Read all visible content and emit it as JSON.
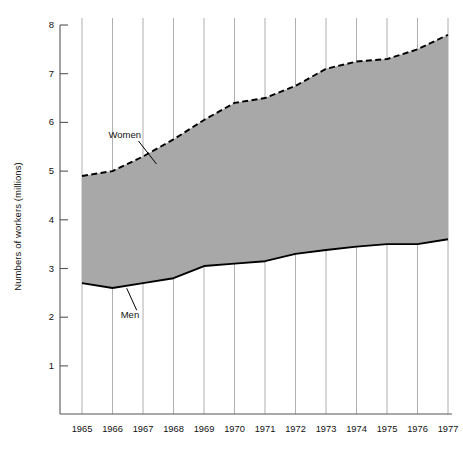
{
  "chart_data": {
    "type": "area",
    "title": "",
    "xlabel": "",
    "ylabel": "Numbers of workers (millions)",
    "categories": [
      1965,
      1966,
      1967,
      1968,
      1969,
      1970,
      1971,
      1972,
      1973,
      1974,
      1975,
      1976,
      1977
    ],
    "xtick_labels": [
      "1965",
      "1966",
      "1967",
      "1968",
      "1969",
      "1970",
      "1971",
      "1972",
      "1973",
      "1974",
      "1975",
      "1976",
      "1977"
    ],
    "ytick_labels": [
      "1",
      "2",
      "3",
      "4",
      "5",
      "6",
      "7",
      "8"
    ],
    "ytick_values": [
      1,
      2,
      3,
      4,
      5,
      6,
      7,
      8
    ],
    "ylim": [
      0,
      8
    ],
    "xlim": [
      1965,
      1977
    ],
    "grid": "vertical",
    "legend": "none",
    "series": [
      {
        "name": "Women",
        "label": "Women",
        "style": "dashed",
        "color": "#000000",
        "values": [
          4.9,
          5.0,
          5.3,
          5.65,
          6.05,
          6.4,
          6.5,
          6.75,
          7.1,
          7.25,
          7.3,
          7.5,
          7.8
        ]
      },
      {
        "name": "Men",
        "label": "Men",
        "style": "solid",
        "color": "#000000",
        "values": [
          2.7,
          2.6,
          2.7,
          2.8,
          3.05,
          3.1,
          3.15,
          3.3,
          3.38,
          3.45,
          3.5,
          3.5,
          3.6
        ]
      }
    ],
    "band": {
      "fill_color": "#a8a8a8",
      "description": "Shaded area between Women (upper) and Men (lower) curves"
    },
    "annotations": [
      {
        "text": "Women",
        "x": 1966.0,
        "y": 5.72
      },
      {
        "text": "Men",
        "x": 1966.4,
        "y": 2.02
      }
    ]
  },
  "axes": {
    "axis_color": "#555555",
    "grid_color": "#9a9a9a"
  }
}
